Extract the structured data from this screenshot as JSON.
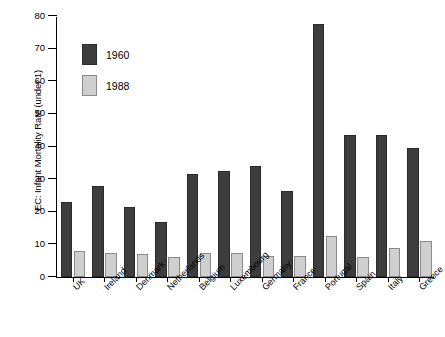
{
  "chart_data": {
    "type": "bar",
    "title": "",
    "subtitle": "",
    "xlabel": "",
    "ylabel": "EC: Infant Mortality Rate (under 1)",
    "ylim": [
      0,
      80
    ],
    "yticks": [
      0,
      10,
      20,
      30,
      40,
      50,
      60,
      70,
      80
    ],
    "ytick_labels": [
      "0",
      "10",
      "20",
      "30",
      "40",
      "50",
      "60",
      "70",
      "80"
    ],
    "grid": false,
    "legend_position": "upper-left-inside",
    "categories": [
      "UK",
      "Ireland",
      "Denmark",
      "Netherlands",
      "Belgium",
      "Luxembourg",
      "Germany",
      "France",
      "Portugal",
      "Spain",
      "Italy",
      "Greece"
    ],
    "series": [
      {
        "name": "1960",
        "color": "#3d3d3d",
        "values": [
          23,
          28,
          21.5,
          17,
          31.5,
          32.5,
          34,
          26.5,
          77.5,
          43.5,
          43.5,
          39.5
        ]
      },
      {
        "name": "1988",
        "color": "#cfcfcf",
        "values": [
          8,
          7.5,
          7,
          6,
          7.5,
          7.5,
          6.5,
          6.5,
          12.5,
          6,
          9,
          11
        ]
      }
    ]
  },
  "legend": {
    "entries": [
      {
        "label": "1960",
        "swatch": "dark-swatch"
      },
      {
        "label": "1988",
        "swatch": "light-swatch"
      }
    ]
  }
}
